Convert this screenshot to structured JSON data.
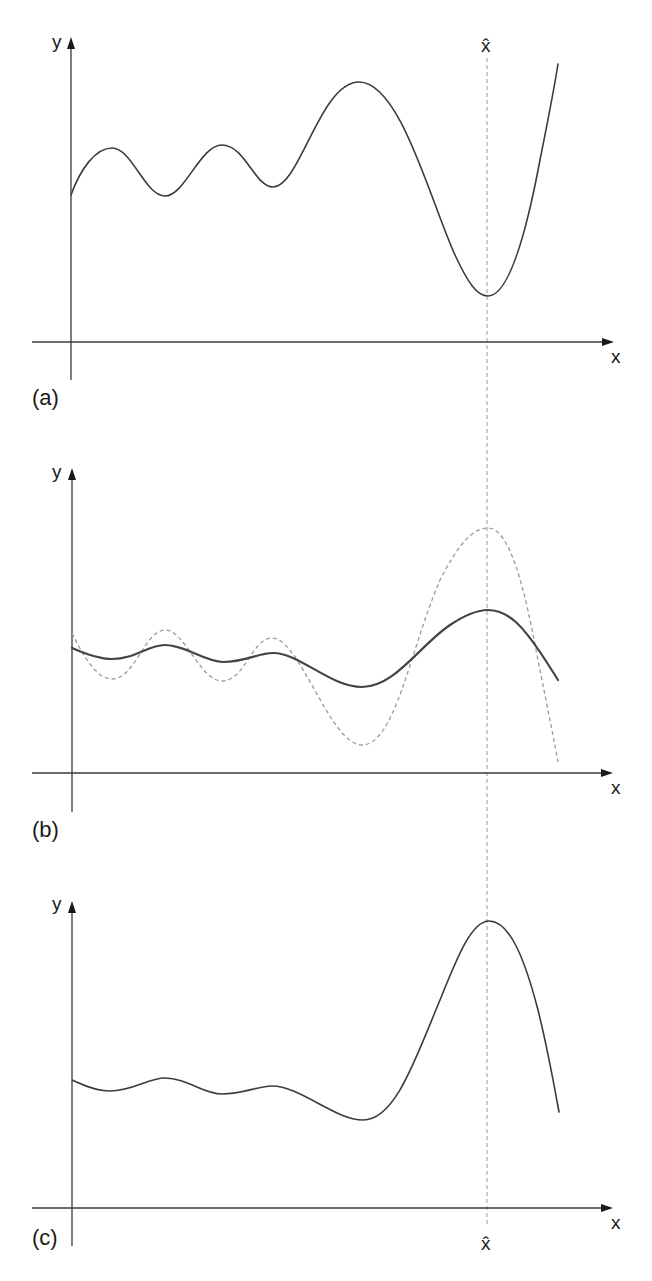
{
  "figure": {
    "guide_label": "x̂",
    "panels": [
      {
        "id": "a",
        "label": "(a)",
        "y_axis_label": "y",
        "x_axis_label": "x",
        "hat_label": "x̂",
        "hat_label_position": "top",
        "curves": [
          {
            "style": "solid",
            "description": "Original multimodal function; small oscillations, a large peak, then a deep global minimum at x-hat followed by steep rise",
            "points": [
              [
                71,
                195
              ],
              [
                112,
                148
              ],
              [
                165,
                196
              ],
              [
                222,
                145
              ],
              [
                273,
                187
              ],
              [
                359,
                82
              ],
              [
                488,
                296
              ],
              [
                558,
                64
              ]
            ]
          }
        ]
      },
      {
        "id": "b",
        "label": "(b)",
        "y_axis_label": "y",
        "x_axis_label": "x",
        "curves": [
          {
            "style": "dashed",
            "description": "Inverted function; large maximum at x-hat",
            "points": [
              [
                72,
                633
              ],
              [
                112,
                679
              ],
              [
                165,
                630
              ],
              [
                222,
                681
              ],
              [
                272,
                638
              ],
              [
                362,
                745
              ],
              [
                488,
                528
              ],
              [
                558,
                762
              ]
            ]
          },
          {
            "style": "solid",
            "description": "Smoothed version of the inverted function",
            "points": [
              [
                72,
                648
              ],
              [
                112,
                659
              ],
              [
                165,
                645
              ],
              [
                223,
                662
              ],
              [
                273,
                653
              ],
              [
                362,
                687
              ],
              [
                488,
                610
              ],
              [
                558,
                680
              ]
            ]
          }
        ]
      },
      {
        "id": "c",
        "label": "(c)",
        "y_axis_label": "y",
        "x_axis_label": "x",
        "hat_label": "x̂",
        "hat_label_position": "bottom",
        "curves": [
          {
            "style": "solid",
            "description": "Transformed function with a single dominant peak at x-hat",
            "points": [
              [
                72,
                1080
              ],
              [
                110,
                1091
              ],
              [
                165,
                1078
              ],
              [
                222,
                1094
              ],
              [
                272,
                1086
              ],
              [
                363,
                1120
              ],
              [
                489,
                921
              ],
              [
                559,
                1112
              ]
            ]
          }
        ]
      }
    ]
  },
  "colors": {
    "axis": "#3a3a3a",
    "curve": "#3c3c3c",
    "dashed": "#9a9a9a",
    "background": "#ffffff"
  }
}
